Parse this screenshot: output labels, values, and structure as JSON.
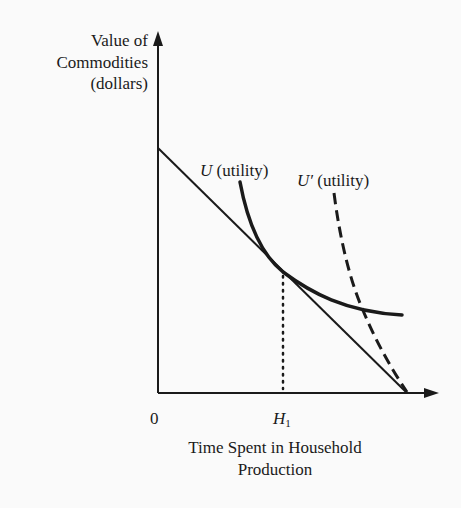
{
  "diagram": {
    "type": "indifference-curve",
    "y_axis": {
      "label_lines": [
        "Value of",
        "Commodities",
        "(dollars)"
      ]
    },
    "x_axis": {
      "label_lines": [
        "Time Spent in Household",
        "Production"
      ],
      "origin_label": "0",
      "tick_label_main": "H",
      "tick_label_sub": "1"
    },
    "curves": [
      {
        "id": "U",
        "symbol": "U",
        "text": " (utility)",
        "style": "solid"
      },
      {
        "id": "U_prime",
        "symbol": "U′",
        "text": " (utility)",
        "style": "dashed"
      }
    ],
    "budget_line": {
      "style": "solid",
      "from": "y-intercept",
      "to": "x-intercept"
    },
    "tangency_marker": {
      "style": "dotted",
      "label": "H1"
    },
    "colors": {
      "ink": "#1a1a1a",
      "background": "#fafafa"
    }
  }
}
